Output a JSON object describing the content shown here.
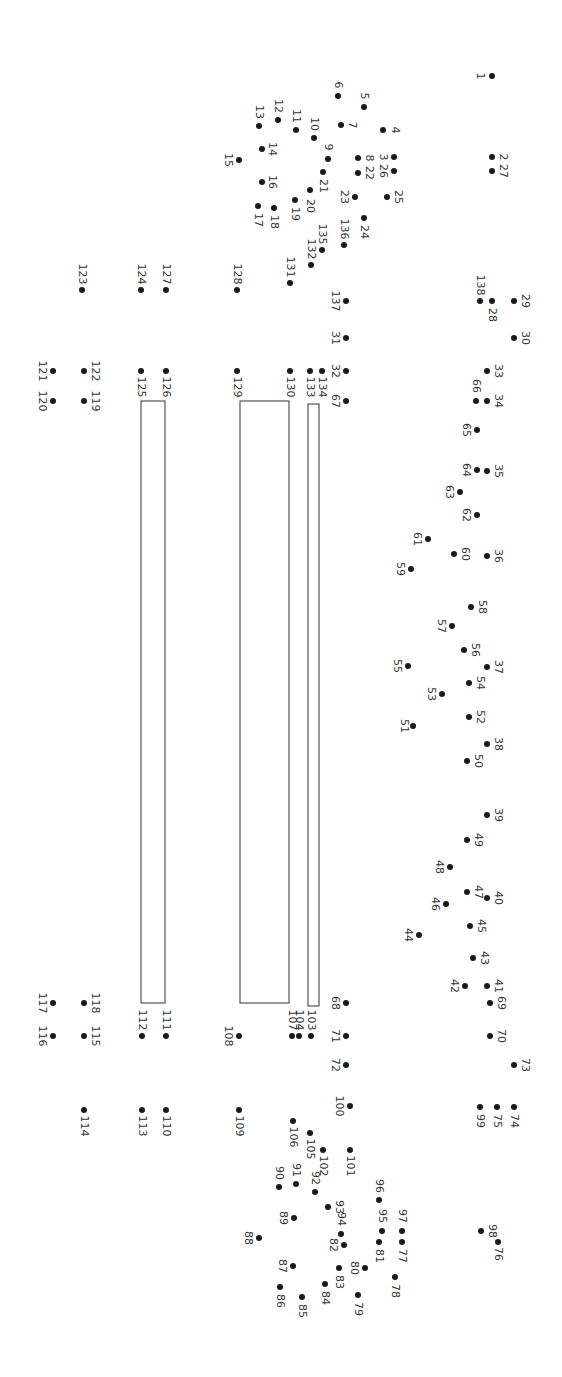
{
  "puzzle": {
    "type": "connect-the-dots",
    "orientation": "rotated-90-clockwise",
    "dot_color": "#1a1a1a",
    "label_color": "#333333",
    "line_color": "#333333",
    "dots": [
      {
        "n": "1",
        "x": 492,
        "y": 76,
        "lx": 480,
        "ly": 76
      },
      {
        "n": "2",
        "x": 492,
        "y": 157,
        "lx": 503,
        "ly": 157
      },
      {
        "n": "3",
        "x": 394,
        "y": 157,
        "lx": 383,
        "ly": 157
      },
      {
        "n": "4",
        "x": 383,
        "y": 130,
        "lx": 395,
        "ly": 130
      },
      {
        "n": "5",
        "x": 364,
        "y": 107,
        "lx": 364,
        "ly": 96
      },
      {
        "n": "6",
        "x": 338,
        "y": 96,
        "lx": 338,
        "ly": 85
      },
      {
        "n": "7",
        "x": 341,
        "y": 125,
        "lx": 352,
        "ly": 125
      },
      {
        "n": "8",
        "x": 358,
        "y": 158,
        "lx": 369,
        "ly": 158
      },
      {
        "n": "9",
        "x": 328,
        "y": 159,
        "lx": 328,
        "ly": 147
      },
      {
        "n": "10",
        "x": 314,
        "y": 138,
        "lx": 314,
        "ly": 124
      },
      {
        "n": "11",
        "x": 296,
        "y": 130,
        "lx": 296,
        "ly": 116
      },
      {
        "n": "12",
        "x": 278,
        "y": 120,
        "lx": 278,
        "ly": 106
      },
      {
        "n": "13",
        "x": 259,
        "y": 126,
        "lx": 259,
        "ly": 112
      },
      {
        "n": "14",
        "x": 262,
        "y": 149,
        "lx": 272,
        "ly": 149
      },
      {
        "n": "15",
        "x": 239,
        "y": 160,
        "lx": 228,
        "ly": 160
      },
      {
        "n": "16",
        "x": 262,
        "y": 182,
        "lx": 272,
        "ly": 182
      },
      {
        "n": "17",
        "x": 258,
        "y": 206,
        "lx": 258,
        "ly": 220
      },
      {
        "n": "18",
        "x": 274,
        "y": 208,
        "lx": 274,
        "ly": 222
      },
      {
        "n": "19",
        "x": 295,
        "y": 200,
        "lx": 295,
        "ly": 214
      },
      {
        "n": "20",
        "x": 310,
        "y": 190,
        "lx": 310,
        "ly": 206
      },
      {
        "n": "21",
        "x": 323,
        "y": 172,
        "lx": 323,
        "ly": 186
      },
      {
        "n": "22",
        "x": 358,
        "y": 173,
        "lx": 369,
        "ly": 173
      },
      {
        "n": "23",
        "x": 355,
        "y": 197,
        "lx": 344,
        "ly": 197
      },
      {
        "n": "24",
        "x": 364,
        "y": 218,
        "lx": 364,
        "ly": 232
      },
      {
        "n": "25",
        "x": 387,
        "y": 197,
        "lx": 398,
        "ly": 197
      },
      {
        "n": "26",
        "x": 394,
        "y": 171,
        "lx": 383,
        "ly": 171
      },
      {
        "n": "27",
        "x": 492,
        "y": 171,
        "lx": 503,
        "ly": 171
      },
      {
        "n": "28",
        "x": 492,
        "y": 301,
        "lx": 492,
        "ly": 315
      },
      {
        "n": "29",
        "x": 514,
        "y": 301,
        "lx": 525,
        "ly": 301
      },
      {
        "n": "30",
        "x": 514,
        "y": 338,
        "lx": 525,
        "ly": 338
      },
      {
        "n": "31",
        "x": 346,
        "y": 338,
        "lx": 335,
        "ly": 338
      },
      {
        "n": "32",
        "x": 346,
        "y": 371,
        "lx": 335,
        "ly": 371
      },
      {
        "n": "33",
        "x": 487,
        "y": 371,
        "lx": 498,
        "ly": 371
      },
      {
        "n": "34",
        "x": 487,
        "y": 401,
        "lx": 498,
        "ly": 401
      },
      {
        "n": "35",
        "x": 487,
        "y": 471,
        "lx": 498,
        "ly": 471
      },
      {
        "n": "36",
        "x": 487,
        "y": 556,
        "lx": 498,
        "ly": 556
      },
      {
        "n": "37",
        "x": 487,
        "y": 667,
        "lx": 498,
        "ly": 667
      },
      {
        "n": "38",
        "x": 487,
        "y": 744,
        "lx": 498,
        "ly": 744
      },
      {
        "n": "39",
        "x": 487,
        "y": 815,
        "lx": 498,
        "ly": 815
      },
      {
        "n": "40",
        "x": 487,
        "y": 898,
        "lx": 498,
        "ly": 898
      },
      {
        "n": "41",
        "x": 487,
        "y": 986,
        "lx": 498,
        "ly": 986
      },
      {
        "n": "42",
        "x": 465,
        "y": 986,
        "lx": 454,
        "ly": 986
      },
      {
        "n": "43",
        "x": 473,
        "y": 958,
        "lx": 484,
        "ly": 958
      },
      {
        "n": "44",
        "x": 419,
        "y": 935,
        "lx": 408,
        "ly": 935
      },
      {
        "n": "45",
        "x": 470,
        "y": 926,
        "lx": 481,
        "ly": 926
      },
      {
        "n": "46",
        "x": 446,
        "y": 904,
        "lx": 435,
        "ly": 904
      },
      {
        "n": "47",
        "x": 467,
        "y": 892,
        "lx": 478,
        "ly": 892
      },
      {
        "n": "48",
        "x": 450,
        "y": 867,
        "lx": 439,
        "ly": 867
      },
      {
        "n": "49",
        "x": 467,
        "y": 840,
        "lx": 478,
        "ly": 840
      },
      {
        "n": "50",
        "x": 467,
        "y": 761,
        "lx": 478,
        "ly": 761
      },
      {
        "n": "51",
        "x": 413,
        "y": 726,
        "lx": 404,
        "ly": 726
      },
      {
        "n": "52",
        "x": 469,
        "y": 717,
        "lx": 480,
        "ly": 717
      },
      {
        "n": "53",
        "x": 442,
        "y": 694,
        "lx": 431,
        "ly": 694
      },
      {
        "n": "54",
        "x": 469,
        "y": 683,
        "lx": 480,
        "ly": 683
      },
      {
        "n": "55",
        "x": 408,
        "y": 666,
        "lx": 397,
        "ly": 666
      },
      {
        "n": "56",
        "x": 464,
        "y": 650,
        "lx": 475,
        "ly": 650
      },
      {
        "n": "57",
        "x": 452,
        "y": 626,
        "lx": 441,
        "ly": 626
      },
      {
        "n": "58",
        "x": 471,
        "y": 607,
        "lx": 482,
        "ly": 607
      },
      {
        "n": "59",
        "x": 411,
        "y": 569,
        "lx": 400,
        "ly": 569
      },
      {
        "n": "60",
        "x": 454,
        "y": 554,
        "lx": 465,
        "ly": 554
      },
      {
        "n": "61",
        "x": 428,
        "y": 539,
        "lx": 417,
        "ly": 539
      },
      {
        "n": "62",
        "x": 477,
        "y": 515,
        "lx": 466,
        "ly": 515
      },
      {
        "n": "63",
        "x": 460,
        "y": 492,
        "lx": 449,
        "ly": 492
      },
      {
        "n": "64",
        "x": 477,
        "y": 470,
        "lx": 466,
        "ly": 470
      },
      {
        "n": "65",
        "x": 477,
        "y": 430,
        "lx": 466,
        "ly": 430
      },
      {
        "n": "66",
        "x": 476,
        "y": 401,
        "lx": 476,
        "ly": 386
      },
      {
        "n": "67",
        "x": 346,
        "y": 401,
        "lx": 335,
        "ly": 401
      },
      {
        "n": "68",
        "x": 346,
        "y": 1003,
        "lx": 335,
        "ly": 1003
      },
      {
        "n": "69",
        "x": 490,
        "y": 1003,
        "lx": 501,
        "ly": 1003
      },
      {
        "n": "70",
        "x": 490,
        "y": 1036,
        "lx": 501,
        "ly": 1036
      },
      {
        "n": "71",
        "x": 346,
        "y": 1036,
        "lx": 335,
        "ly": 1036
      },
      {
        "n": "72",
        "x": 346,
        "y": 1065,
        "lx": 335,
        "ly": 1065
      },
      {
        "n": "73",
        "x": 514,
        "y": 1065,
        "lx": 525,
        "ly": 1065
      },
      {
        "n": "74",
        "x": 514,
        "y": 1107,
        "lx": 514,
        "ly": 1121
      },
      {
        "n": "75",
        "x": 497,
        "y": 1107,
        "lx": 497,
        "ly": 1121
      },
      {
        "n": "76",
        "x": 498,
        "y": 1242,
        "lx": 498,
        "ly": 1254
      },
      {
        "n": "77",
        "x": 402,
        "y": 1242,
        "lx": 402,
        "ly": 1256
      },
      {
        "n": "78",
        "x": 395,
        "y": 1277,
        "lx": 395,
        "ly": 1291
      },
      {
        "n": "79",
        "x": 358,
        "y": 1295,
        "lx": 358,
        "ly": 1309
      },
      {
        "n": "80",
        "x": 365,
        "y": 1268,
        "lx": 354,
        "ly": 1268
      },
      {
        "n": "81",
        "x": 379,
        "y": 1242,
        "lx": 379,
        "ly": 1256
      },
      {
        "n": "82",
        "x": 344,
        "y": 1245,
        "lx": 333,
        "ly": 1245
      },
      {
        "n": "83",
        "x": 339,
        "y": 1268,
        "lx": 339,
        "ly": 1282
      },
      {
        "n": "84",
        "x": 325,
        "y": 1284,
        "lx": 325,
        "ly": 1298
      },
      {
        "n": "85",
        "x": 302,
        "y": 1297,
        "lx": 302,
        "ly": 1311
      },
      {
        "n": "86",
        "x": 280,
        "y": 1287,
        "lx": 280,
        "ly": 1301
      },
      {
        "n": "87",
        "x": 293,
        "y": 1266,
        "lx": 282,
        "ly": 1266
      },
      {
        "n": "88",
        "x": 259,
        "y": 1238,
        "lx": 248,
        "ly": 1238
      },
      {
        "n": "89",
        "x": 294,
        "y": 1218,
        "lx": 283,
        "ly": 1218
      },
      {
        "n": "90",
        "x": 279,
        "y": 1187,
        "lx": 279,
        "ly": 1173
      },
      {
        "n": "91",
        "x": 296,
        "y": 1184,
        "lx": 296,
        "ly": 1170
      },
      {
        "n": "92",
        "x": 315,
        "y": 1192,
        "lx": 315,
        "ly": 1178
      },
      {
        "n": "93",
        "x": 328,
        "y": 1207,
        "lx": 339,
        "ly": 1207
      },
      {
        "n": "94",
        "x": 341,
        "y": 1234,
        "lx": 341,
        "ly": 1219
      },
      {
        "n": "95",
        "x": 382,
        "y": 1231,
        "lx": 382,
        "ly": 1216
      },
      {
        "n": "96",
        "x": 379,
        "y": 1200,
        "lx": 379,
        "ly": 1186
      },
      {
        "n": "97",
        "x": 402,
        "y": 1231,
        "lx": 402,
        "ly": 1216
      },
      {
        "n": "98",
        "x": 481,
        "y": 1231,
        "lx": 492,
        "ly": 1231
      },
      {
        "n": "99",
        "x": 480,
        "y": 1107,
        "lx": 480,
        "ly": 1121
      },
      {
        "n": "100",
        "x": 350,
        "y": 1106,
        "lx": 339,
        "ly": 1106
      },
      {
        "n": "101",
        "x": 350,
        "y": 1150,
        "lx": 350,
        "ly": 1166
      },
      {
        "n": "102",
        "x": 323,
        "y": 1150,
        "lx": 323,
        "ly": 1166
      },
      {
        "n": "103",
        "x": 311,
        "y": 1036,
        "lx": 311,
        "ly": 1020
      },
      {
        "n": "104",
        "x": 299,
        "y": 1036,
        "lx": 299,
        "ly": 1020
      },
      {
        "n": "105",
        "x": 310,
        "y": 1133,
        "lx": 310,
        "ly": 1149
      },
      {
        "n": "106",
        "x": 293,
        "y": 1121,
        "lx": 293,
        "ly": 1137
      },
      {
        "n": "107",
        "x": 292,
        "y": 1036,
        "lx": 292,
        "ly": 1020
      },
      {
        "n": "108",
        "x": 239,
        "y": 1036,
        "lx": 228,
        "ly": 1036
      },
      {
        "n": "109",
        "x": 239,
        "y": 1110,
        "lx": 239,
        "ly": 1126
      },
      {
        "n": "110",
        "x": 166,
        "y": 1110,
        "lx": 166,
        "ly": 1126
      },
      {
        "n": "111",
        "x": 166,
        "y": 1036,
        "lx": 166,
        "ly": 1020
      },
      {
        "n": "112",
        "x": 142,
        "y": 1036,
        "lx": 142,
        "ly": 1020
      },
      {
        "n": "113",
        "x": 142,
        "y": 1110,
        "lx": 142,
        "ly": 1126
      },
      {
        "n": "114",
        "x": 84,
        "y": 1110,
        "lx": 84,
        "ly": 1126
      },
      {
        "n": "115",
        "x": 84,
        "y": 1036,
        "lx": 95,
        "ly": 1036
      },
      {
        "n": "116",
        "x": 53,
        "y": 1036,
        "lx": 42,
        "ly": 1036
      },
      {
        "n": "117",
        "x": 53,
        "y": 1003,
        "lx": 42,
        "ly": 1003
      },
      {
        "n": "118",
        "x": 84,
        "y": 1003,
        "lx": 95,
        "ly": 1003
      },
      {
        "n": "119",
        "x": 84,
        "y": 401,
        "lx": 95,
        "ly": 401
      },
      {
        "n": "120",
        "x": 53,
        "y": 401,
        "lx": 42,
        "ly": 401
      },
      {
        "n": "121",
        "x": 53,
        "y": 371,
        "lx": 42,
        "ly": 371
      },
      {
        "n": "122",
        "x": 84,
        "y": 371,
        "lx": 95,
        "ly": 371
      },
      {
        "n": "123",
        "x": 82,
        "y": 290,
        "lx": 82,
        "ly": 274
      },
      {
        "n": "124",
        "x": 141,
        "y": 290,
        "lx": 141,
        "ly": 274
      },
      {
        "n": "125",
        "x": 141,
        "y": 371,
        "lx": 141,
        "ly": 387
      },
      {
        "n": "126",
        "x": 166,
        "y": 371,
        "lx": 166,
        "ly": 387
      },
      {
        "n": "127",
        "x": 166,
        "y": 290,
        "lx": 166,
        "ly": 274
      },
      {
        "n": "128",
        "x": 237,
        "y": 290,
        "lx": 237,
        "ly": 274
      },
      {
        "n": "129",
        "x": 237,
        "y": 371,
        "lx": 237,
        "ly": 387
      },
      {
        "n": "130",
        "x": 290,
        "y": 371,
        "lx": 290,
        "ly": 387
      },
      {
        "n": "131",
        "x": 290,
        "y": 283,
        "lx": 290,
        "ly": 267
      },
      {
        "n": "132",
        "x": 311,
        "y": 265,
        "lx": 311,
        "ly": 249
      },
      {
        "n": "133",
        "x": 310,
        "y": 371,
        "lx": 310,
        "ly": 387
      },
      {
        "n": "134",
        "x": 322,
        "y": 371,
        "lx": 322,
        "ly": 387
      },
      {
        "n": "135",
        "x": 322,
        "y": 250,
        "lx": 322,
        "ly": 234
      },
      {
        "n": "136",
        "x": 344,
        "y": 245,
        "lx": 344,
        "ly": 229
      },
      {
        "n": "137",
        "x": 346,
        "y": 301,
        "lx": 335,
        "ly": 301
      },
      {
        "n": "138",
        "x": 480,
        "y": 301,
        "lx": 480,
        "ly": 285
      }
    ],
    "rectangles": [
      {
        "name": "pre-drawn-rect-left",
        "x": 141,
        "y": 401,
        "w": 24,
        "h": 602
      },
      {
        "name": "pre-drawn-rect-middle",
        "x": 240,
        "y": 401,
        "w": 49,
        "h": 602
      },
      {
        "name": "pre-drawn-rect-narrow",
        "x": 308,
        "y": 404,
        "w": 11,
        "h": 602
      }
    ]
  }
}
